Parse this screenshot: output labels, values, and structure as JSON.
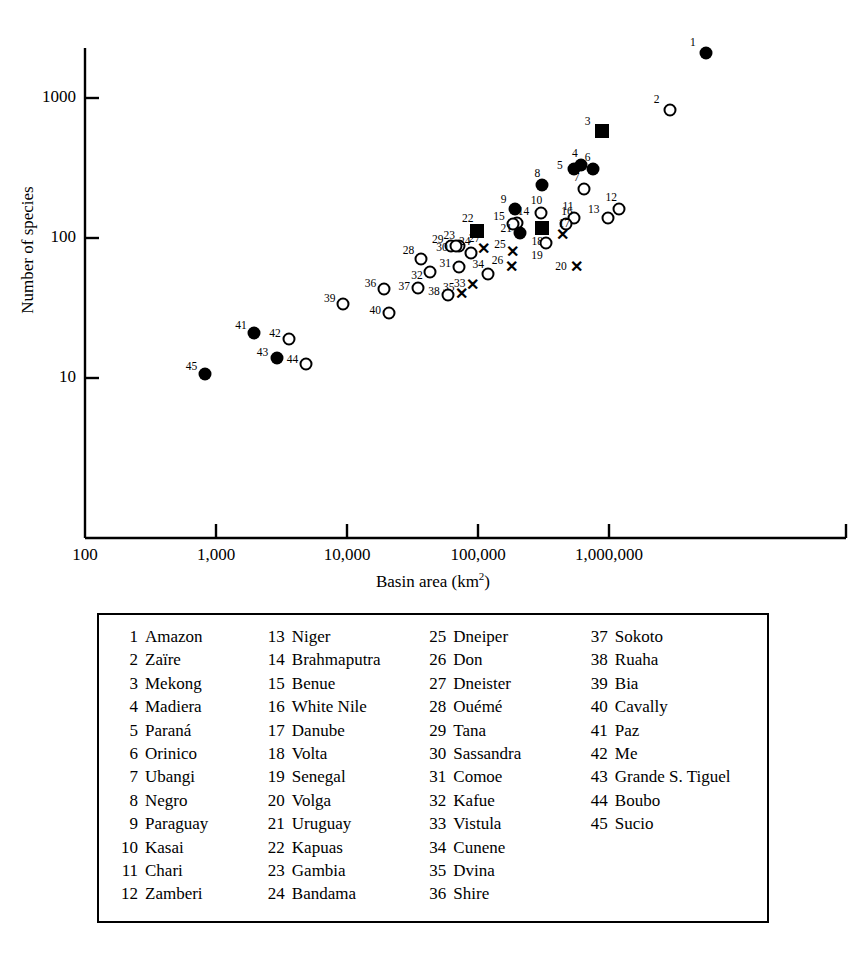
{
  "chart_data": {
    "type": "scatter",
    "title": "",
    "xlabel": "Basin area (km2)",
    "xlabel_base": "Basin area (km",
    "xlabel_sup": "2",
    "xlabel_tail": ")",
    "ylabel": "Number of species",
    "xscale": "log",
    "yscale": "log",
    "xlim": [
      100,
      10000000
    ],
    "ylim": [
      3,
      3000
    ],
    "xticks": [
      "100",
      "1,000",
      "10,000",
      "100,000",
      "1,000,000"
    ],
    "xtick_values": [
      100,
      1000,
      10000,
      100000,
      1000000
    ],
    "yticks": [
      "1000",
      "100",
      "10"
    ],
    "ytick_values": [
      1000,
      100,
      10
    ],
    "grid": false,
    "legend_position": "below-plot-box",
    "marker_types": [
      "filled-circle",
      "open-circle",
      "filled-square",
      "cross"
    ],
    "points": [
      {
        "id": 1,
        "name": "Amazon",
        "x": 5500000,
        "y": 2100,
        "marker": "filled-circle",
        "label_dx": -13,
        "label_dy": -11
      },
      {
        "id": 2,
        "name": "Zaïre",
        "x": 2900000,
        "y": 820,
        "marker": "open-circle",
        "label_dx": -13,
        "label_dy": -11
      },
      {
        "id": 3,
        "name": "Mekong",
        "x": 880000,
        "y": 580,
        "marker": "filled-square",
        "label_dx": -14,
        "label_dy": -10
      },
      {
        "id": 4,
        "name": "Madiera",
        "x": 610000,
        "y": 330,
        "marker": "filled-circle",
        "label_dx": -6,
        "label_dy": -12
      },
      {
        "id": 5,
        "name": "Paraná",
        "x": 540000,
        "y": 310,
        "marker": "filled-circle",
        "label_dx": -14,
        "label_dy": -4
      },
      {
        "id": 6,
        "name": "Orinico",
        "x": 750000,
        "y": 310,
        "marker": "filled-circle",
        "label_dx": -5,
        "label_dy": -12
      },
      {
        "id": 7,
        "name": "Ubangi",
        "x": 640000,
        "y": 225,
        "marker": "open-circle",
        "label_dx": -7,
        "label_dy": -12
      },
      {
        "id": 8,
        "name": "Negro",
        "x": 310000,
        "y": 240,
        "marker": "filled-circle",
        "label_dx": -5,
        "label_dy": -12
      },
      {
        "id": 9,
        "name": "Paraguay",
        "x": 190000,
        "y": 160,
        "marker": "filled-circle",
        "label_dx": -11,
        "label_dy": -10
      },
      {
        "id": 10,
        "name": "Kasai",
        "x": 300000,
        "y": 150,
        "marker": "open-circle",
        "label_dx": -4,
        "label_dy": -13
      },
      {
        "id": 11,
        "name": "Chari",
        "x": 540000,
        "y": 140,
        "marker": "open-circle",
        "label_dx": -6,
        "label_dy": -12
      },
      {
        "id": 12,
        "name": "Zamberi",
        "x": 1200000,
        "y": 160,
        "marker": "open-circle",
        "label_dx": -8,
        "label_dy": -12
      },
      {
        "id": 13,
        "name": "Niger",
        "x": 980000,
        "y": 140,
        "marker": "open-circle",
        "label_dx": -14,
        "label_dy": -9
      },
      {
        "id": 14,
        "name": "Brahmaputra",
        "x": 200000,
        "y": 128,
        "marker": "open-circle",
        "label_dx": 6,
        "label_dy": -12
      },
      {
        "id": 15,
        "name": "Benue",
        "x": 185000,
        "y": 125,
        "marker": "open-circle",
        "label_dx": -14,
        "label_dy": -8
      },
      {
        "id": 16,
        "name": "White Nile",
        "x": 470000,
        "y": 125,
        "marker": "open-circle",
        "label_dx": 1,
        "label_dy": -13
      },
      {
        "id": 17,
        "name": "Danube",
        "x": 440000,
        "y": 105,
        "marker": "cross",
        "label_dx": 2,
        "label_dy": -12
      },
      {
        "id": 18,
        "name": "Volta",
        "x": 310000,
        "y": 118,
        "marker": "filled-square",
        "label_dx": -5,
        "label_dy": 13
      },
      {
        "id": 19,
        "name": "Senegal",
        "x": 330000,
        "y": 92,
        "marker": "open-circle",
        "label_dx": -9,
        "label_dy": 12
      },
      {
        "id": 20,
        "name": "Volga",
        "x": 560000,
        "y": 62,
        "marker": "cross",
        "label_dx": -15,
        "label_dy": -1
      },
      {
        "id": 21,
        "name": "Uruguay",
        "x": 210000,
        "y": 108,
        "marker": "filled-circle",
        "label_dx": -14,
        "label_dy": -5
      },
      {
        "id": 22,
        "name": "Kapuas",
        "x": 98000,
        "y": 112,
        "marker": "filled-square",
        "label_dx": -9,
        "label_dy": -13
      },
      {
        "id": 23,
        "name": "Gambia",
        "x": 72000,
        "y": 88,
        "marker": "open-circle",
        "label_dx": -10,
        "label_dy": -11
      },
      {
        "id": 24,
        "name": "Bandama",
        "x": 88000,
        "y": 78,
        "marker": "open-circle",
        "label_dx": -6,
        "label_dy": -12
      },
      {
        "id": 25,
        "name": "Dneiper",
        "x": 185000,
        "y": 80,
        "marker": "cross",
        "label_dx": -13,
        "label_dy": -8
      },
      {
        "id": 26,
        "name": "Don",
        "x": 180000,
        "y": 62,
        "marker": "cross",
        "label_dx": -14,
        "label_dy": -7
      },
      {
        "id": 27,
        "name": "Dneister",
        "x": 110000,
        "y": 83,
        "marker": "cross",
        "label_dx": -9,
        "label_dy": -11
      },
      {
        "id": 28,
        "name": "Ouémé",
        "x": 37000,
        "y": 71,
        "marker": "open-circle",
        "label_dx": -13,
        "label_dy": -9
      },
      {
        "id": 29,
        "name": "Tana",
        "x": 62000,
        "y": 87,
        "marker": "open-circle",
        "label_dx": -13,
        "label_dy": -7
      },
      {
        "id": 30,
        "name": "Sassandra",
        "x": 68000,
        "y": 87,
        "marker": "open-circle",
        "label_dx": -14,
        "label_dy": 1
      },
      {
        "id": 31,
        "name": "Comoe",
        "x": 72000,
        "y": 62,
        "marker": "open-circle",
        "label_dx": -14,
        "label_dy": -4
      },
      {
        "id": 32,
        "name": "Kafue",
        "x": 43000,
        "y": 57,
        "marker": "open-circle",
        "label_dx": -13,
        "label_dy": 3
      },
      {
        "id": 33,
        "name": "Vistula",
        "x": 91000,
        "y": 46,
        "marker": "cross",
        "label_dx": -13,
        "label_dy": -2
      },
      {
        "id": 34,
        "name": "Cunene",
        "x": 120000,
        "y": 55,
        "marker": "open-circle",
        "label_dx": -10,
        "label_dy": -10
      },
      {
        "id": 35,
        "name": "Dvina",
        "x": 75000,
        "y": 40,
        "marker": "cross",
        "label_dx": -13,
        "label_dy": -7
      },
      {
        "id": 36,
        "name": "Shire",
        "x": 19000,
        "y": 43,
        "marker": "open-circle",
        "label_dx": -13,
        "label_dy": -6
      },
      {
        "id": 37,
        "name": "Sokoto",
        "x": 35000,
        "y": 44,
        "marker": "open-circle",
        "label_dx": -14,
        "label_dy": -2
      },
      {
        "id": 38,
        "name": "Ruaha",
        "x": 59000,
        "y": 39,
        "marker": "open-circle",
        "label_dx": -14,
        "label_dy": -4
      },
      {
        "id": 39,
        "name": "Bia",
        "x": 9300,
        "y": 34,
        "marker": "open-circle",
        "label_dx": -13,
        "label_dy": -6
      },
      {
        "id": 40,
        "name": "Cavally",
        "x": 21000,
        "y": 29,
        "marker": "open-circle",
        "label_dx": -14,
        "label_dy": -3
      },
      {
        "id": 41,
        "name": "Paz",
        "x": 1950,
        "y": 21,
        "marker": "filled-circle",
        "label_dx": -13,
        "label_dy": -8
      },
      {
        "id": 42,
        "name": "Me",
        "x": 3600,
        "y": 19,
        "marker": "open-circle",
        "label_dx": -14,
        "label_dy": -6
      },
      {
        "id": 43,
        "name": "Grande S. Tiguel",
        "x": 2900,
        "y": 14,
        "marker": "filled-circle",
        "label_dx": -14,
        "label_dy": -6
      },
      {
        "id": 44,
        "name": "Boubo",
        "x": 4900,
        "y": 12.5,
        "marker": "open-circle",
        "label_dx": -14,
        "label_dy": -5
      },
      {
        "id": 45,
        "name": "Sucio",
        "x": 830,
        "y": 10.7,
        "marker": "filled-circle",
        "label_dx": -14,
        "label_dy": -8
      }
    ]
  },
  "legend": {
    "columns": [
      [
        {
          "num": "1",
          "name": "Amazon"
        },
        {
          "num": "2",
          "name": "Zaïre"
        },
        {
          "num": "3",
          "name": "Mekong"
        },
        {
          "num": "4",
          "name": "Madiera"
        },
        {
          "num": "5",
          "name": "Paraná"
        },
        {
          "num": "6",
          "name": "Orinico"
        },
        {
          "num": "7",
          "name": "Ubangi"
        },
        {
          "num": "8",
          "name": "Negro"
        },
        {
          "num": "9",
          "name": "Paraguay"
        },
        {
          "num": "10",
          "name": "Kasai"
        },
        {
          "num": "11",
          "name": "Chari"
        },
        {
          "num": "12",
          "name": "Zamberi"
        }
      ],
      [
        {
          "num": "13",
          "name": "Niger"
        },
        {
          "num": "14",
          "name": "Brahmaputra"
        },
        {
          "num": "15",
          "name": "Benue"
        },
        {
          "num": "16",
          "name": "White Nile"
        },
        {
          "num": "17",
          "name": "Danube"
        },
        {
          "num": "18",
          "name": "Volta"
        },
        {
          "num": "19",
          "name": "Senegal"
        },
        {
          "num": "20",
          "name": "Volga"
        },
        {
          "num": "21",
          "name": "Uruguay"
        },
        {
          "num": "22",
          "name": "Kapuas"
        },
        {
          "num": "23",
          "name": "Gambia"
        },
        {
          "num": "24",
          "name": "Bandama"
        }
      ],
      [
        {
          "num": "25",
          "name": "Dneiper"
        },
        {
          "num": "26",
          "name": "Don"
        },
        {
          "num": "27",
          "name": "Dneister"
        },
        {
          "num": "28",
          "name": "Ouémé"
        },
        {
          "num": "29",
          "name": "Tana"
        },
        {
          "num": "30",
          "name": "Sassandra"
        },
        {
          "num": "31",
          "name": "Comoe"
        },
        {
          "num": "32",
          "name": "Kafue"
        },
        {
          "num": "33",
          "name": "Vistula"
        },
        {
          "num": "34",
          "name": "Cunene"
        },
        {
          "num": "35",
          "name": "Dvina"
        },
        {
          "num": "36",
          "name": "Shire"
        }
      ],
      [
        {
          "num": "37",
          "name": "Sokoto"
        },
        {
          "num": "38",
          "name": "Ruaha"
        },
        {
          "num": "39",
          "name": "Bia"
        },
        {
          "num": "40",
          "name": "Cavally"
        },
        {
          "num": "41",
          "name": "Paz"
        },
        {
          "num": "42",
          "name": "Me"
        },
        {
          "num": "43",
          "name": "Grande S. Tiguel"
        },
        {
          "num": "44",
          "name": "Boubo"
        },
        {
          "num": "45",
          "name": "Sucio"
        }
      ]
    ]
  },
  "colors": {
    "ink": "#000000",
    "background": "#ffffff"
  }
}
